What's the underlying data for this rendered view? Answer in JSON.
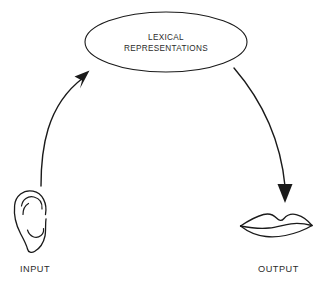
{
  "diagram": {
    "title_lines": [
      "LEXICAL",
      "REPRESENTATIONS"
    ],
    "central_node": {
      "line1": "LEXICAL",
      "line2": "REPRESENTATIONS",
      "shape": "ellipse"
    },
    "input": {
      "label": "INPUT",
      "icon": "ear-icon"
    },
    "output": {
      "label": "OUTPUT",
      "icon": "lips-icon"
    },
    "arrows": [
      {
        "name": "input-to-lexical-arrow",
        "direction": "up-right",
        "from": "input",
        "to": "central_node"
      },
      {
        "name": "lexical-to-output-arrow",
        "direction": "down",
        "from": "central_node",
        "to": "output"
      }
    ],
    "colors": {
      "stroke": "#1a1a1a",
      "text": "#2b2b2b",
      "background": "#ffffff"
    }
  }
}
